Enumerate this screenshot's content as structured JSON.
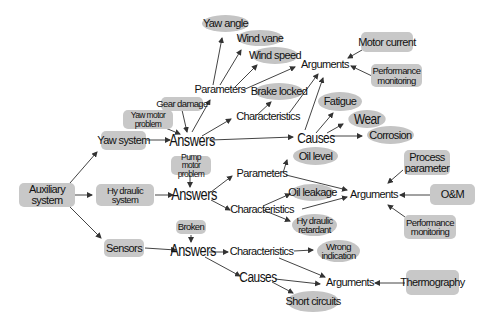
{
  "diagram": {
    "nodes": {
      "auxiliary_system": "Auxiliary system",
      "yaw_system": "Yaw system",
      "hydraulic_system": "Hy draulic system",
      "sensors": "Sensors",
      "yaw_answers": "Answers",
      "yaw_motor_problem": "Yaw motor problem",
      "gear_damage": "Gear damage",
      "yaw_parameters": "Parameters",
      "yaw_angle": "Yaw angle",
      "wind_vane": "Wind vane",
      "wind_speed": "Wind speed",
      "yaw_characteristics": "Characteristics",
      "brake_locked": "Brake locked",
      "yaw_causes": "Causes",
      "fatigue": "Fatigue",
      "wear": "Wear",
      "corrosion": "Corrosion",
      "yaw_arguments": "Arguments",
      "motor_current": "Motor current",
      "yaw_performance_monitoring": "Performance monitoring",
      "pump_motor_problem": "Pump motor problem",
      "hyd_answers": "Answers",
      "hyd_parameters": "Parameters",
      "oil_level": "Oil level",
      "hyd_characteristics": "Characteristics",
      "oil_leakage": "Oil leakage",
      "hydraulic_retardant": "Hy draulic retardant",
      "hyd_arguments": "Arguments",
      "process_parameter": "Process parameter",
      "om": "O&M",
      "hyd_performance_monitoring": "Performance monitoring",
      "broken": "Broken",
      "sen_answers": "Answers",
      "sen_characteristics": "Characteristics",
      "wrong_indication": "Wrong indication",
      "sen_causes": "Causes",
      "short_circuits": "Short circuits",
      "sen_arguments": "Arguments",
      "thermography": "Thermography"
    },
    "edges": [
      [
        "auxiliary_system",
        "yaw_system"
      ],
      [
        "auxiliary_system",
        "hydraulic_system"
      ],
      [
        "auxiliary_system",
        "sensors"
      ],
      [
        "yaw_system",
        "yaw_answers"
      ],
      [
        "yaw_motor_problem",
        "yaw_answers"
      ],
      [
        "gear_damage",
        "yaw_answers"
      ],
      [
        "yaw_answers",
        "yaw_parameters"
      ],
      [
        "yaw_answers",
        "yaw_characteristics"
      ],
      [
        "yaw_answers",
        "yaw_causes"
      ],
      [
        "yaw_parameters",
        "yaw_angle"
      ],
      [
        "yaw_parameters",
        "wind_vane"
      ],
      [
        "yaw_parameters",
        "wind_speed"
      ],
      [
        "yaw_parameters",
        "yaw_arguments"
      ],
      [
        "yaw_characteristics",
        "brake_locked"
      ],
      [
        "yaw_characteristics",
        "yaw_arguments"
      ],
      [
        "yaw_causes",
        "fatigue"
      ],
      [
        "yaw_causes",
        "wear"
      ],
      [
        "yaw_causes",
        "corrosion"
      ],
      [
        "yaw_causes",
        "yaw_arguments"
      ],
      [
        "motor_current",
        "yaw_arguments"
      ],
      [
        "yaw_performance_monitoring",
        "yaw_arguments"
      ],
      [
        "hydraulic_system",
        "hyd_answers"
      ],
      [
        "pump_motor_problem",
        "hyd_answers"
      ],
      [
        "hyd_answers",
        "hyd_parameters"
      ],
      [
        "hyd_answers",
        "hyd_characteristics"
      ],
      [
        "hyd_parameters",
        "oil_level"
      ],
      [
        "hyd_parameters",
        "hyd_arguments"
      ],
      [
        "hyd_characteristics",
        "oil_leakage"
      ],
      [
        "hyd_characteristics",
        "hydraulic_retardant"
      ],
      [
        "hyd_characteristics",
        "hyd_arguments"
      ],
      [
        "process_parameter",
        "hyd_arguments"
      ],
      [
        "om",
        "hyd_arguments"
      ],
      [
        "hyd_performance_monitoring",
        "hyd_arguments"
      ],
      [
        "sensors",
        "sen_answers"
      ],
      [
        "broken",
        "sen_answers"
      ],
      [
        "sen_answers",
        "sen_characteristics"
      ],
      [
        "sen_answers",
        "sen_causes"
      ],
      [
        "sen_characteristics",
        "wrong_indication"
      ],
      [
        "sen_characteristics",
        "sen_arguments"
      ],
      [
        "sen_causes",
        "short_circuits"
      ],
      [
        "sen_causes",
        "sen_arguments"
      ],
      [
        "thermography",
        "sen_arguments"
      ]
    ]
  }
}
